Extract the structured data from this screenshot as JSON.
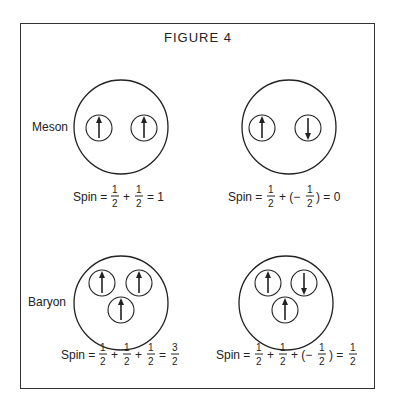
{
  "figure": {
    "title": "FIGURE 4",
    "colors": {
      "line": "#222222",
      "background": "#ffffff"
    }
  },
  "panels": [
    {
      "id": "meson-aligned",
      "row_label": "Meson",
      "quark_spins": [
        "up",
        "up"
      ],
      "equation": {
        "prefix": "Spin =",
        "terms": [
          "1/2",
          "+",
          "1/2"
        ],
        "result": "= 1"
      }
    },
    {
      "id": "meson-opposed",
      "row_label": "",
      "quark_spins": [
        "up",
        "down"
      ],
      "equation": {
        "prefix": "Spin =",
        "terms": [
          "1/2",
          "+ (−",
          "1/2",
          ")"
        ],
        "result": "= 0"
      }
    },
    {
      "id": "baryon-aligned",
      "row_label": "Baryon",
      "quark_spins": [
        "up",
        "up",
        "up"
      ],
      "equation": {
        "prefix": "Spin =",
        "terms": [
          "1/2",
          "+",
          "1/2",
          "+",
          "1/2"
        ],
        "result": "= 3/2"
      }
    },
    {
      "id": "baryon-mixed",
      "row_label": "",
      "quark_spins": [
        "up",
        "down",
        "up"
      ],
      "equation": {
        "prefix": "Spin =",
        "terms": [
          "1/2",
          "+",
          "1/2",
          "+ (−",
          "1/2",
          ")"
        ],
        "result": "= 1/2"
      }
    }
  ],
  "labels": {
    "meson": "Meson",
    "baryon": "Baryon",
    "spin": "Spin",
    "one": "1",
    "two": "2",
    "three": "3",
    "zero": "0"
  }
}
